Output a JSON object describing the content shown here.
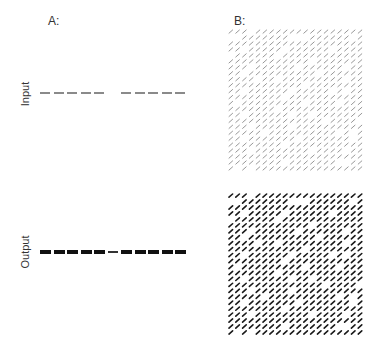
{
  "panels": {
    "a": {
      "label": "A:",
      "rows": {
        "input": {
          "label": "Input",
          "segments": [
            {
              "present": true,
              "weight": "thin"
            },
            {
              "present": true,
              "weight": "thin"
            },
            {
              "present": true,
              "weight": "thin"
            },
            {
              "present": true,
              "weight": "thin"
            },
            {
              "present": true,
              "weight": "thin"
            },
            {
              "present": false,
              "weight": "none"
            },
            {
              "present": true,
              "weight": "thin"
            },
            {
              "present": true,
              "weight": "thin"
            },
            {
              "present": true,
              "weight": "thin"
            },
            {
              "present": true,
              "weight": "thin"
            },
            {
              "present": true,
              "weight": "thin"
            }
          ],
          "color": "#8a8a8a"
        },
        "output": {
          "label": "Output",
          "segments": [
            {
              "present": true,
              "weight": "thick"
            },
            {
              "present": true,
              "weight": "thick"
            },
            {
              "present": true,
              "weight": "thick"
            },
            {
              "present": true,
              "weight": "thick"
            },
            {
              "present": true,
              "weight": "thick"
            },
            {
              "present": true,
              "weight": "thin"
            },
            {
              "present": true,
              "weight": "thick"
            },
            {
              "present": true,
              "weight": "thick"
            },
            {
              "present": true,
              "weight": "thick"
            },
            {
              "present": true,
              "weight": "thick"
            },
            {
              "present": true,
              "weight": "thick"
            }
          ],
          "color": "#111111"
        }
      }
    },
    "b": {
      "label": "B:",
      "grid_columns": 20,
      "grid_rows": 24,
      "input_color": "#8c8c8c",
      "output_color": "#1a1a1a",
      "pattern": [
        "///.////////////////",
        "..///////...//////./",
        "////////////////////",
        "//./////.//////.////",
        ".//////.////////////",
        "////////////.///////",
        "///.//////.//////.//",
        "//.//////////.//////",
        "////.//./////////.//",
        "///////////.////////",
        "//.//////./////././/",
        "////////.///////////",
        "/./////////.////.///",
        "///////.////////////",
        "//.//////.//.///////",
        "//////////////.////.",
        "///./////.//////////",
        "/////.//////////././/",
        "//.///////.///////.//",
        "////////.///////////",
        "///.////////.////.//",
        "////////////////////",
        "////////.///////..//",
        "/././///////////////"
      ]
    }
  }
}
